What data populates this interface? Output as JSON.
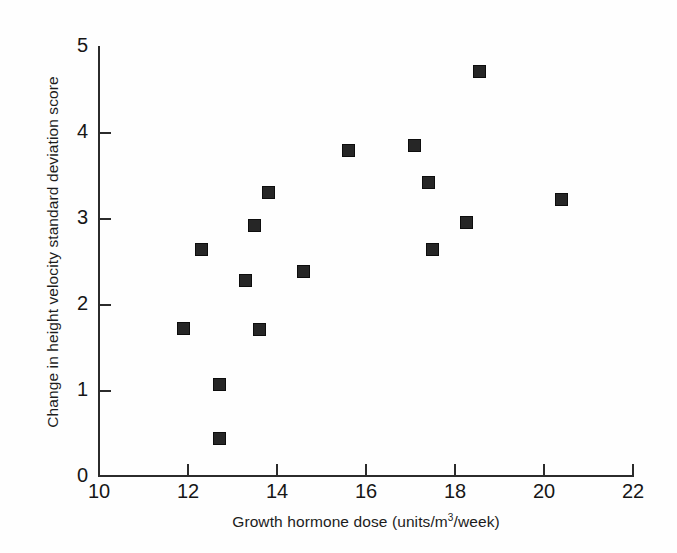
{
  "chart_data": {
    "type": "scatter",
    "title": "",
    "xlabel": "Growth hormone dose  (units/m3/week)",
    "xlabel_prefix": "Growth hormone dose  (units/m",
    "xlabel_superscript": "3",
    "xlabel_suffix": "/week)",
    "ylabel": "Change in height velocity standard deviation score",
    "xlim": [
      10,
      22
    ],
    "ylim": [
      0,
      5
    ],
    "xticks": [
      10,
      12,
      14,
      16,
      18,
      20,
      22
    ],
    "yticks": [
      0,
      1,
      2,
      3,
      4,
      5
    ],
    "grid": false,
    "legend": false,
    "marker": "filled-square",
    "marker_color": "#262626",
    "axis_color": "#2b2b2b",
    "background_color": "#ffffff",
    "points": [
      {
        "x": 11.9,
        "y": 1.73
      },
      {
        "x": 12.3,
        "y": 2.64
      },
      {
        "x": 12.7,
        "y": 1.07
      },
      {
        "x": 12.7,
        "y": 0.45
      },
      {
        "x": 13.3,
        "y": 2.29
      },
      {
        "x": 13.5,
        "y": 2.93
      },
      {
        "x": 13.6,
        "y": 1.72
      },
      {
        "x": 13.8,
        "y": 3.31
      },
      {
        "x": 14.6,
        "y": 2.39
      },
      {
        "x": 15.6,
        "y": 3.8
      },
      {
        "x": 17.1,
        "y": 3.86
      },
      {
        "x": 17.4,
        "y": 3.43
      },
      {
        "x": 17.5,
        "y": 2.65
      },
      {
        "x": 18.25,
        "y": 2.96
      },
      {
        "x": 18.54,
        "y": 4.71
      },
      {
        "x": 20.4,
        "y": 3.23
      }
    ]
  }
}
